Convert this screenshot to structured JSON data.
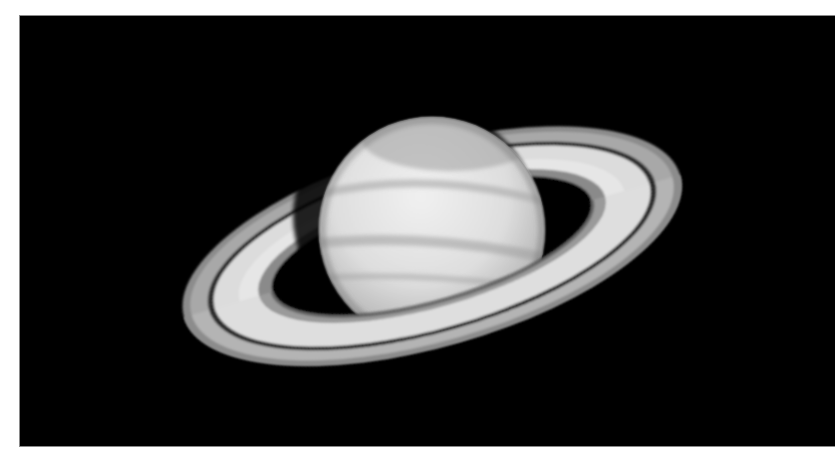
{
  "image": {
    "subject": "Saturn with rings",
    "alt": "Grayscale telescope photograph of Saturn with its ring system tilted, on a black background",
    "colors": {
      "page_background": "#ffffff",
      "sky": "#000000",
      "planet_light": "#e8e8e8",
      "planet_shadow": "#9a9a9a",
      "ring_bright": "#e0e0e0",
      "ring_mid": "#b0b0b0",
      "cassini_division": "#2a2a2a"
    },
    "caption": ""
  }
}
